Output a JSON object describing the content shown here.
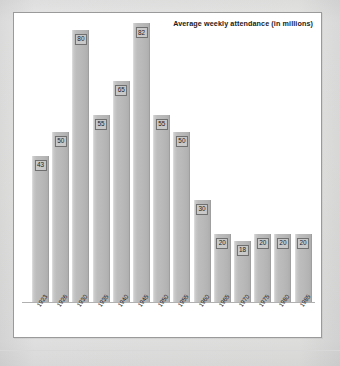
{
  "chart_data": {
    "type": "bar",
    "title": "Average weekly attendance (in millions)",
    "xlabel": "",
    "ylabel": "",
    "ylim": [
      0,
      82
    ],
    "grid": false,
    "legend": "none",
    "categories": [
      "1923",
      "1926",
      "1930",
      "1935",
      "1940",
      "1945",
      "1950",
      "1955",
      "1960",
      "1965",
      "1970",
      "1975",
      "1980",
      "1985"
    ],
    "values": [
      43,
      50,
      80,
      55,
      65,
      82,
      55,
      50,
      30,
      20,
      18,
      20,
      20,
      20
    ],
    "data_labels": [
      "43",
      "50",
      "80",
      "55",
      "65",
      "82",
      "55",
      "50",
      "30",
      "20",
      "18",
      "20",
      "20",
      "20"
    ],
    "colors": {
      "bar_fill": "#bbbbbb",
      "bar_edge": "#9f9f9f",
      "label_box_fill": "#c9c9c9",
      "label_box_edge": "#6f6f6f",
      "plot_background": "#ffffff",
      "frame_border": "#9a9a9a",
      "page_background": "#ececec",
      "text": "#1b1b1b"
    }
  }
}
